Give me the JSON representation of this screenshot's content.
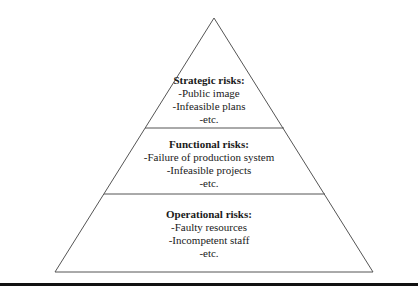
{
  "diagram": {
    "type": "pyramid",
    "colors": {
      "stroke": "#555555",
      "fill": "#ffffff",
      "text": "#1a1a1a",
      "rule": "#111111"
    },
    "tiers": [
      {
        "level": "top",
        "heading": "Strategic risks:",
        "items": [
          "-Public image",
          "-Infeasible plans",
          "-etc."
        ]
      },
      {
        "level": "middle",
        "heading": "Functional risks:",
        "items": [
          "-Failure of production system",
          "-Infeasible projects",
          "-etc."
        ]
      },
      {
        "level": "bottom",
        "heading": "Operational risks:",
        "items": [
          "-Faulty resources",
          "-Incompetent staff",
          "-etc."
        ]
      }
    ]
  }
}
